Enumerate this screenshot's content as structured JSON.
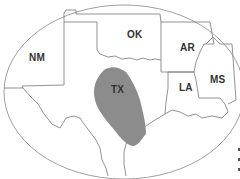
{
  "map": {
    "region": "South-central United States",
    "frame": "ellipse",
    "states": [
      {
        "abbr": "NM",
        "label_x": 30,
        "label_y": 52
      },
      {
        "abbr": "OK",
        "label_x": 125,
        "label_y": 30
      },
      {
        "abbr": "AR",
        "label_x": 180,
        "label_y": 42
      },
      {
        "abbr": "LA",
        "label_x": 180,
        "label_y": 84
      },
      {
        "abbr": "MS",
        "label_x": 212,
        "label_y": 75
      },
      {
        "abbr": "TX",
        "label_x": 112,
        "label_y": 86
      }
    ],
    "highlighted_region": {
      "state": "TX",
      "fill": "#8c8c8c"
    },
    "colors": {
      "background": "#ffffff",
      "border": "#777777",
      "highlight": "#8c8c8c",
      "label": "#333333"
    }
  }
}
